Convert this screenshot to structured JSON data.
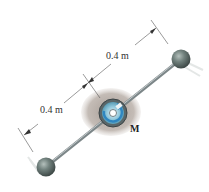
{
  "diagram": {
    "type": "mechanics-rod-with-two-spheres",
    "labels": {
      "upper_dimension": "0.4 m",
      "lower_dimension": "0.4 m",
      "moment": "M"
    },
    "colors": {
      "rod": "#8a9496",
      "sphere": "#6f7e7a",
      "hub_shadow": "#b8b0aa",
      "hub_ring": "#4a5456",
      "hub_fill": "#8fc6da",
      "moment_arrow": "#2f86c0",
      "dimension_line": "#555555",
      "text": "#333333"
    }
  }
}
